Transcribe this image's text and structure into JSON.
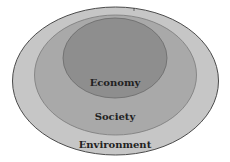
{
  "diagram": {
    "type": "nested-ellipses",
    "layers": [
      {
        "label": "Environment",
        "color": "#c4c4c4",
        "stroke": "#555555"
      },
      {
        "label": "Society",
        "color": "#a8a8a8",
        "stroke": "#7a7a7a"
      },
      {
        "label": "Economy",
        "color": "#8c8c8c",
        "stroke": "#6a6a6a"
      }
    ]
  }
}
